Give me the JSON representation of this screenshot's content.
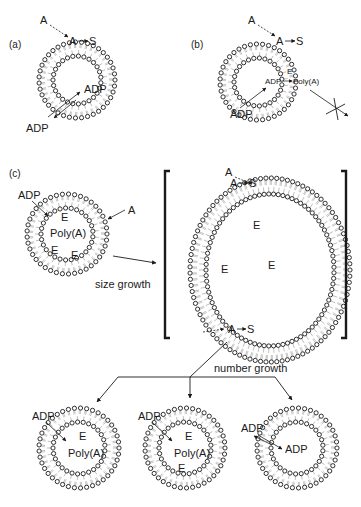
{
  "colors": {
    "ink": "#1a1a1a",
    "lipid_tail": "#8a8a8a",
    "background": "#ffffff"
  },
  "panels": {
    "a": {
      "label": "(a)",
      "vesicle": {
        "cx": 77,
        "cy": 80,
        "r_outer": 38,
        "r_inner": 24
      },
      "labels": {
        "precursor": "A",
        "conversion_from": "A",
        "conversion_to": "S",
        "adp_inside": "ADP",
        "adp_outside": "ADP"
      }
    },
    "b": {
      "label": "(b)",
      "vesicle": {
        "cx": 258,
        "cy": 82,
        "r_outer": 38,
        "r_inner": 24
      },
      "labels": {
        "precursor": "A",
        "conversion_from": "A",
        "conversion_to": "S",
        "enzyme": "E",
        "reaction_from": "ADP",
        "reaction_to": "Poly(A)",
        "adp_outside": "ADP"
      }
    },
    "c": {
      "label": "(c)",
      "vesicle_small": {
        "cx": 67,
        "cy": 234,
        "r_outer": 40,
        "r_inner": 26
      },
      "vesicle_large": {
        "cx": 270,
        "cy": 270,
        "rx_outer": 80,
        "ry_outer": 92,
        "rx_inner": 64,
        "ry_inner": 76
      },
      "small_labels": {
        "adp": "ADP",
        "precursor": "A",
        "enzymes": [
          "E",
          "E",
          "E"
        ],
        "polymer": "Poly(A)"
      },
      "large_labels": {
        "precursor_top": "A",
        "conversion_top_from": "A",
        "conversion_top_to": "S",
        "conversion_bottom_from": "A",
        "conversion_bottom_to": "S",
        "enzymes": [
          "E",
          "E",
          "E"
        ]
      },
      "size_growth_label": "size growth",
      "number_growth_label": "number growth",
      "daughters": [
        {
          "cx": 79,
          "cy": 448,
          "adp": "ADP",
          "enzymes": [
            "E"
          ],
          "polymer": "Poly(A)"
        },
        {
          "cx": 185,
          "cy": 448,
          "adp": "ADP",
          "enzymes": [
            "E",
            "E"
          ],
          "polymer": "Poly(A)"
        },
        {
          "cx": 297,
          "cy": 448,
          "adp": "ADP",
          "adp_inner": "ADP",
          "enzymes": [],
          "polymer": ""
        }
      ]
    }
  }
}
